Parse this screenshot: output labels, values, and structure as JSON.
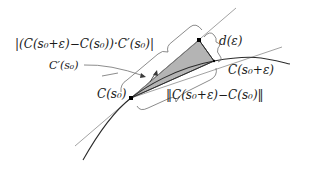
{
  "diagram": {
    "type": "geometric-construction",
    "colors": {
      "background": "#ffffff",
      "curve": "#2b2b2b",
      "tangent_line": "#8a8a8a",
      "secant_line": "#8a8a8a",
      "shaded_triangle": "#b0b0b0",
      "points": "#000000",
      "braces": "#6e6e6e"
    },
    "labels": {
      "projection": "|(C(s₀+ε)−C(s₀))·C′(s₀)|",
      "tangent": "C′(s₀)",
      "base_point": "C(s₀)",
      "distance": "d(ε)",
      "moved_point": "C(s₀+ε)",
      "chord_length": "‖C(s₀+ε)−C(s₀)‖"
    },
    "points": [
      {
        "name": "C(s0)",
        "x": 131,
        "y": 98
      },
      {
        "name": "projection-foot",
        "x": 199,
        "y": 40
      },
      {
        "name": "C(s0+eps)",
        "x": 214,
        "y": 61
      }
    ]
  }
}
